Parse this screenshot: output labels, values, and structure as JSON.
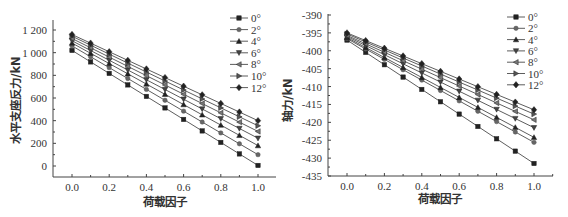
{
  "chart_data": [
    {
      "type": "line",
      "title": "",
      "xlabel": "荷载因子",
      "ylabel": "水平支座反力/kN",
      "xlim": [
        -0.1,
        1.1
      ],
      "ylim": [
        -100,
        1300
      ],
      "xticks": [
        0.0,
        0.2,
        0.4,
        0.6,
        0.8,
        1.0
      ],
      "xtick_labels": [
        "0.0",
        "0.2",
        "0.4",
        "0.6",
        "0.8",
        "1.0"
      ],
      "yticks": [
        0,
        200,
        400,
        600,
        800,
        1000,
        1200
      ],
      "ytick_labels": [
        "0",
        "200",
        "400",
        "600",
        "800",
        "1 000",
        "1 200"
      ],
      "grid": false,
      "legend_position": "upper right",
      "x": [
        0.0,
        0.1,
        0.2,
        0.3,
        0.4,
        0.5,
        0.6,
        0.7,
        0.8,
        0.9,
        1.0
      ],
      "series": [
        {
          "name": "0°",
          "marker": "square",
          "start": 1020,
          "end": 5
        },
        {
          "name": "2°",
          "marker": "circle",
          "start": 1060,
          "end": 100
        },
        {
          "name": "4°",
          "marker": "triangle-up",
          "start": 1085,
          "end": 180
        },
        {
          "name": "6°",
          "marker": "triangle-down",
          "start": 1105,
          "end": 245
        },
        {
          "name": "8°",
          "marker": "triangle-left",
          "start": 1125,
          "end": 305
        },
        {
          "name": "10°",
          "marker": "triangle-right",
          "start": 1145,
          "end": 355
        },
        {
          "name": "12°",
          "marker": "diamond",
          "start": 1160,
          "end": 400
        }
      ]
    },
    {
      "type": "line",
      "title": "",
      "xlabel": "荷载因子",
      "ylabel": "轴力/kN",
      "xlim": [
        -0.1,
        1.1
      ],
      "ylim": [
        -435,
        -390
      ],
      "xticks": [
        0.0,
        0.2,
        0.4,
        0.6,
        0.8,
        1.0
      ],
      "xtick_labels": [
        "0.0",
        "0.2",
        "0.4",
        "0.6",
        "0.8",
        "1.0"
      ],
      "yticks": [
        -390,
        -395,
        -400,
        -405,
        -410,
        -415,
        -420,
        -425,
        -430,
        -435
      ],
      "ytick_labels": [
        "-390",
        "-395",
        "-400",
        "-405",
        "-410",
        "-415",
        "-420",
        "-425",
        "-430",
        "-435"
      ],
      "grid": false,
      "legend_position": "upper right",
      "x": [
        0.0,
        0.1,
        0.2,
        0.3,
        0.4,
        0.5,
        0.6,
        0.7,
        0.8,
        0.9,
        1.0
      ],
      "series": [
        {
          "name": "0°",
          "marker": "square",
          "start": -397.0,
          "end": -431.5
        },
        {
          "name": "2°",
          "marker": "circle",
          "start": -396.6,
          "end": -425.6
        },
        {
          "name": "4°",
          "marker": "triangle-up",
          "start": -396.3,
          "end": -424.2
        },
        {
          "name": "6°",
          "marker": "triangle-down",
          "start": -396.0,
          "end": -421.5
        },
        {
          "name": "8°",
          "marker": "triangle-left",
          "start": -395.7,
          "end": -419.3
        },
        {
          "name": "10°",
          "marker": "triangle-right",
          "start": -395.3,
          "end": -417.7
        },
        {
          "name": "12°",
          "marker": "diamond",
          "start": -395.0,
          "end": -416.5
        }
      ]
    }
  ],
  "layout": [
    {
      "plot": {
        "x0": 53,
        "x1": 276,
        "y_axis_bottom": 177,
        "y_axis_top": 20,
        "px_x0": 72,
        "px_x1": 258,
        "px_yv0": 166,
        "px_yv1": 30,
        "v0": 0,
        "v1": 1200
      },
      "legend": {
        "x": 230,
        "y": 18,
        "dy": 11.6
      },
      "ylabel_pos": {
        "x": 20,
        "y": 100
      },
      "xlabel_pos": {
        "x": 165,
        "y": 206
      }
    },
    {
      "plot": {
        "x0": 328,
        "x1": 553,
        "y_axis_bottom": 176,
        "y_axis_top": 14,
        "px_x0": 347,
        "px_x1": 534,
        "px_yv0": 15,
        "px_yv1": 176,
        "v0": -390,
        "v1": -435
      },
      "legend": {
        "x": 507,
        "y": 17,
        "dy": 11.3
      },
      "ylabel_pos": {
        "x": 292,
        "y": 100
      },
      "xlabel_pos": {
        "x": 440,
        "y": 203
      }
    }
  ]
}
